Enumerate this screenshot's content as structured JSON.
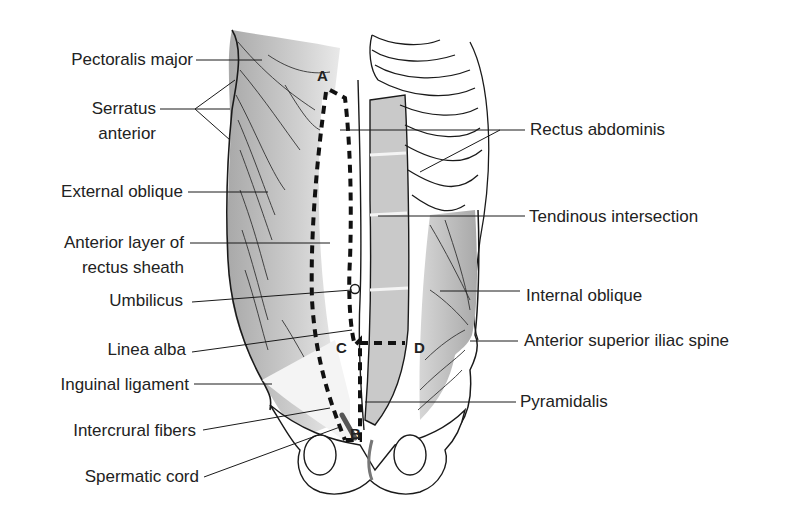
{
  "figure": {
    "left_labels": [
      {
        "id": "pectoralis-major",
        "text": "Pectoralis major"
      },
      {
        "id": "serratus-anterior-1",
        "text": "Serratus"
      },
      {
        "id": "serratus-anterior-2",
        "text": "anterior"
      },
      {
        "id": "external-oblique",
        "text": "External oblique"
      },
      {
        "id": "anterior-layer-1",
        "text": "Anterior layer of"
      },
      {
        "id": "anterior-layer-2",
        "text": "rectus sheath"
      },
      {
        "id": "umbilicus",
        "text": "Umbilicus"
      },
      {
        "id": "linea-alba",
        "text": "Linea alba"
      },
      {
        "id": "inguinal-ligament",
        "text": "Inguinal ligament"
      },
      {
        "id": "intercrural-fibers",
        "text": "Intercrural fibers"
      },
      {
        "id": "spermatic-cord",
        "text": "Spermatic cord"
      }
    ],
    "right_labels": [
      {
        "id": "rectus-abdominis",
        "text": "Rectus abdominis"
      },
      {
        "id": "tendinous-intersection",
        "text": "Tendinous intersection"
      },
      {
        "id": "internal-oblique",
        "text": "Internal oblique"
      },
      {
        "id": "asis",
        "text": "Anterior superior iliac spine"
      },
      {
        "id": "pyramidalis",
        "text": "Pyramidalis"
      }
    ],
    "markers": {
      "A": "A",
      "B": "B",
      "C": "C",
      "D": "D"
    },
    "colors": {
      "muscle_fill": "#c8c8c8",
      "muscle_dark": "#b0b0b0",
      "line": "#1a1a1a",
      "background": "#ffffff"
    }
  }
}
